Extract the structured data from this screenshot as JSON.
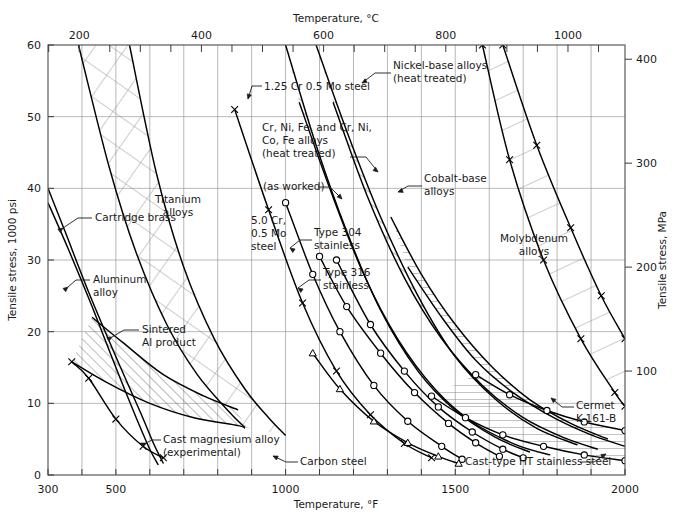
{
  "chart_data": {
    "type": "line",
    "title": "",
    "xlabel": "Temperature, °F",
    "xlabel_top": "Temperature, °C",
    "ylabel": "Tensile stress, 1000 psi",
    "ylabel_right": "Tensile stress, MPa",
    "xlim": [
      300,
      2000
    ],
    "ylim": [
      0,
      60
    ],
    "ylim_right": [
      0,
      414
    ],
    "grid": true,
    "legend_position": "in-plot annotations",
    "x_ticks_f": [
      300,
      400,
      500,
      600,
      700,
      800,
      900,
      1000,
      1100,
      1200,
      1300,
      1400,
      1500,
      1600,
      1700,
      1800,
      1900,
      2000
    ],
    "x_tick_labels_f": [
      "300",
      "",
      "500",
      "",
      "",
      "",
      "",
      "1000",
      "",
      "",
      "",
      "",
      "1500",
      "",
      "",
      "",
      "",
      "2000"
    ],
    "x_ticks_c": [
      150,
      200,
      250,
      300,
      350,
      400,
      450,
      500,
      550,
      600,
      650,
      700,
      750,
      800,
      850,
      900,
      950,
      1000,
      1050,
      1100
    ],
    "x_tick_labels_c": [
      "",
      "200",
      "",
      "",
      "",
      "400",
      "",
      "",
      "",
      "600",
      "",
      "",
      "",
      "800",
      "",
      "",
      "",
      "1000",
      "",
      ""
    ],
    "y_ticks_psi": [
      0,
      10,
      20,
      30,
      40,
      50,
      60
    ],
    "y_tick_labels_psi": [
      "0",
      "10",
      "20",
      "30",
      "40",
      "50",
      "60"
    ],
    "y_ticks_mpa": [
      100,
      200,
      300,
      400
    ],
    "y_tick_labels_mpa": [
      "100",
      "200",
      "300",
      "400"
    ],
    "series": [
      {
        "name": "Cartridge brass",
        "marker": "none",
        "points": [
          [
            300,
            40.0
          ],
          [
            350,
            34.0
          ],
          [
            420,
            25.5
          ],
          [
            500,
            16.5
          ],
          [
            570,
            9.0
          ],
          [
            610,
            4.5
          ],
          [
            640,
            1.6
          ]
        ]
      },
      {
        "name": "Aluminum alloy",
        "marker": "none",
        "points": [
          [
            300,
            38.0
          ],
          [
            360,
            31.5
          ],
          [
            430,
            23.5
          ],
          [
            500,
            15.0
          ],
          [
            560,
            8.0
          ],
          [
            600,
            3.6
          ],
          [
            625,
            1.4
          ]
        ]
      },
      {
        "name": "Cast magnesium alloy (experimental)",
        "marker": "x",
        "points": [
          [
            370,
            15.8
          ],
          [
            420,
            13.5
          ],
          [
            500,
            7.8
          ],
          [
            580,
            4.0
          ],
          [
            640,
            2.4
          ]
        ]
      },
      {
        "name": "Sintered Al product upper",
        "marker": "none",
        "points": [
          [
            430,
            22.0
          ],
          [
            520,
            18.5
          ],
          [
            640,
            14.0
          ],
          [
            760,
            11.0
          ],
          [
            860,
            9.1
          ]
        ]
      },
      {
        "name": "Sintered Al product lower",
        "marker": "none",
        "points": [
          [
            370,
            15.8
          ],
          [
            470,
            13.0
          ],
          [
            600,
            10.0
          ],
          [
            730,
            8.0
          ],
          [
            860,
            6.9
          ],
          [
            880,
            6.5
          ]
        ]
      },
      {
        "name": "Titanium alloys band upper",
        "marker": "none",
        "points": [
          [
            390,
            60.0
          ],
          [
            480,
            43.0
          ],
          [
            560,
            31.0
          ],
          [
            650,
            21.0
          ],
          [
            740,
            14.0
          ],
          [
            830,
            9.0
          ],
          [
            880,
            6.6
          ]
        ]
      },
      {
        "name": "Titanium alloys band lower",
        "marker": "none",
        "points": [
          [
            540,
            60.0
          ],
          [
            620,
            42.0
          ],
          [
            700,
            29.0
          ],
          [
            790,
            19.0
          ],
          [
            880,
            12.0
          ],
          [
            950,
            8.0
          ],
          [
            1000,
            5.5
          ]
        ]
      },
      {
        "name": "1.25 Cr 0.5 Mo steel",
        "marker": "x",
        "points": [
          [
            850,
            51.0
          ],
          [
            950,
            37.0
          ],
          [
            1050,
            24.0
          ],
          [
            1150,
            14.5
          ],
          [
            1250,
            8.4
          ],
          [
            1350,
            4.4
          ],
          [
            1430,
            2.4
          ]
        ]
      },
      {
        "name": "5.0 Cr, 0.5 Mo steel",
        "marker": "circle",
        "points": [
          [
            1000,
            38.0
          ],
          [
            1080,
            28.0
          ],
          [
            1160,
            20.0
          ],
          [
            1260,
            12.5
          ],
          [
            1360,
            7.5
          ],
          [
            1460,
            4.0
          ],
          [
            1520,
            2.2
          ]
        ]
      },
      {
        "name": "Type 304 stainless",
        "marker": "circle",
        "points": [
          [
            1100,
            30.5
          ],
          [
            1180,
            23.5
          ],
          [
            1280,
            17.0
          ],
          [
            1380,
            11.5
          ],
          [
            1480,
            7.2
          ],
          [
            1560,
            4.5
          ],
          [
            1630,
            2.6
          ]
        ]
      },
      {
        "name": "Type 316 stainless",
        "marker": "circle",
        "points": [
          [
            1150,
            30.0
          ],
          [
            1250,
            21.0
          ],
          [
            1350,
            14.5
          ],
          [
            1450,
            9.5
          ],
          [
            1550,
            6.0
          ],
          [
            1640,
            3.6
          ],
          [
            1700,
            2.4
          ]
        ]
      },
      {
        "name": "Carbon steel",
        "marker": "triangle",
        "points": [
          [
            1080,
            17.0
          ],
          [
            1160,
            12.0
          ],
          [
            1260,
            7.5
          ],
          [
            1360,
            4.5
          ],
          [
            1450,
            2.6
          ],
          [
            1510,
            1.6
          ]
        ]
      },
      {
        "name": "Cr, Ni, Fe, and Cr, Ni, Co, Fe alloys (heat treated) upper",
        "marker": "none",
        "points": [
          [
            1000,
            60.0
          ],
          [
            1090,
            46.0
          ],
          [
            1180,
            34.0
          ],
          [
            1280,
            23.0
          ],
          [
            1390,
            14.5
          ],
          [
            1500,
            9.0
          ],
          [
            1620,
            5.2
          ],
          [
            1720,
            3.2
          ]
        ]
      },
      {
        "name": "Cr, Ni, Fe, and Cr, Ni, Co, Fe alloys (as worked) lower",
        "marker": "none",
        "points": [
          [
            1040,
            52.0
          ],
          [
            1130,
            40.0
          ],
          [
            1230,
            28.0
          ],
          [
            1330,
            19.0
          ],
          [
            1440,
            12.0
          ],
          [
            1550,
            7.4
          ],
          [
            1680,
            4.2
          ],
          [
            1780,
            2.8
          ]
        ]
      },
      {
        "name": "Nickel-base alloys (heat treated) upper",
        "marker": "none",
        "points": [
          [
            1090,
            60.0
          ],
          [
            1180,
            48.0
          ],
          [
            1280,
            36.0
          ],
          [
            1390,
            25.0
          ],
          [
            1500,
            16.5
          ],
          [
            1620,
            10.5
          ],
          [
            1740,
            6.5
          ],
          [
            1860,
            4.2
          ]
        ]
      },
      {
        "name": "Nickel-base alloys (heat treated) lower",
        "marker": "none",
        "points": [
          [
            1140,
            52.0
          ],
          [
            1240,
            39.0
          ],
          [
            1350,
            27.5
          ],
          [
            1460,
            19.0
          ],
          [
            1580,
            12.5
          ],
          [
            1700,
            8.0
          ],
          [
            1820,
            5.2
          ],
          [
            1920,
            3.6
          ]
        ]
      },
      {
        "name": "Cobalt-base alloys upper",
        "marker": "none",
        "points": [
          [
            1310,
            36.0
          ],
          [
            1400,
            28.0
          ],
          [
            1500,
            21.0
          ],
          [
            1610,
            15.0
          ],
          [
            1720,
            10.5
          ],
          [
            1840,
            7.2
          ],
          [
            1950,
            5.0
          ]
        ]
      },
      {
        "name": "Cobalt-base alloys lower",
        "marker": "none",
        "points": [
          [
            1360,
            29.0
          ],
          [
            1460,
            22.0
          ],
          [
            1560,
            16.0
          ],
          [
            1670,
            11.5
          ],
          [
            1790,
            8.0
          ],
          [
            1900,
            5.6
          ],
          [
            2000,
            4.0
          ]
        ]
      },
      {
        "name": "Molybdenum alloys upper",
        "marker": "x",
        "points": [
          [
            1640,
            60.0
          ],
          [
            1740,
            46.0
          ],
          [
            1840,
            34.5
          ],
          [
            1930,
            25.0
          ],
          [
            2000,
            19.0
          ]
        ]
      },
      {
        "name": "Molybdenum alloys lower",
        "marker": "x",
        "points": [
          [
            1580,
            60.0
          ],
          [
            1660,
            44.0
          ],
          [
            1760,
            30.0
          ],
          [
            1870,
            19.0
          ],
          [
            1970,
            11.5
          ],
          [
            2000,
            9.6
          ]
        ]
      },
      {
        "name": "Cermet K-161-B",
        "marker": "circle",
        "points": [
          [
            1560,
            14.0
          ],
          [
            1660,
            11.2
          ],
          [
            1770,
            9.0
          ],
          [
            1880,
            7.4
          ],
          [
            2000,
            6.2
          ]
        ]
      },
      {
        "name": "Cast-type HT stainless steel",
        "marker": "circle",
        "points": [
          [
            1430,
            11.0
          ],
          [
            1530,
            8.0
          ],
          [
            1640,
            5.6
          ],
          [
            1760,
            4.0
          ],
          [
            1880,
            2.8
          ],
          [
            2000,
            2.0
          ]
        ]
      }
    ],
    "annotations": [
      {
        "text": "Cartridge brass",
        "x": 95,
        "y": 221,
        "anchor": "start",
        "leader": true
      },
      {
        "text": "Aluminum\nalloy",
        "x": 93,
        "y": 283,
        "anchor": "start",
        "leader": true
      },
      {
        "text": "Sintered\nAl product",
        "x": 142,
        "y": 333,
        "anchor": "start",
        "leader": true
      },
      {
        "text": "Cast magnesium alloy\n(experimental)",
        "x": 163,
        "y": 443,
        "anchor": "start",
        "leader": true
      },
      {
        "text": "Titanium\nalloys",
        "x": 178,
        "y": 203,
        "anchor": "middle",
        "leader": false
      },
      {
        "text": "1.25 Cr 0.5 Mo steel",
        "x": 264,
        "y": 90,
        "anchor": "start",
        "leader": true
      },
      {
        "text": "Cr, Ni, Fe, and Cr, Ni,\nCo, Fe alloys\n(heat treated)",
        "x": 262,
        "y": 131,
        "anchor": "start",
        "leader": true
      },
      {
        "text": "(as worked)",
        "x": 263,
        "y": 190,
        "anchor": "start",
        "leader": true
      },
      {
        "text": "5.0 Cr,\n0.5 Mo\nsteel",
        "x": 251,
        "y": 224,
        "anchor": "start",
        "leader": false
      },
      {
        "text": "Type 304\nstainless",
        "x": 314,
        "y": 236,
        "anchor": "start",
        "leader": true
      },
      {
        "text": "Type 316\nstainless",
        "x": 323,
        "y": 276,
        "anchor": "start",
        "leader": true
      },
      {
        "text": "Nickel-base alloys\n(heat treated)",
        "x": 393,
        "y": 69,
        "anchor": "start",
        "leader": true
      },
      {
        "text": "Cobalt-base\nalloys",
        "x": 424,
        "y": 182,
        "anchor": "start",
        "leader": true
      },
      {
        "text": "Molybdenum\nalloys",
        "x": 534,
        "y": 242,
        "anchor": "middle",
        "leader": false
      },
      {
        "text": "Cermet\nK-161-B",
        "x": 576,
        "y": 409,
        "anchor": "start",
        "leader": true
      },
      {
        "text": "Carbon steel",
        "x": 300,
        "y": 465,
        "anchor": "start",
        "leader": true
      },
      {
        "text": "Cast-type HT stainless steel",
        "x": 465,
        "y": 465,
        "anchor": "start",
        "leader": true
      }
    ],
    "regions": [
      {
        "name": "Titanium alloys",
        "hatch": "cross"
      },
      {
        "name": "Nickel-base alloys",
        "hatch": "diagonal"
      },
      {
        "name": "Cobalt-base alloys",
        "hatch": "horizontal"
      },
      {
        "name": "Molybdenum alloys",
        "hatch": "diagonal-wide"
      },
      {
        "name": "Sintered Al product",
        "hatch": "diagonal"
      }
    ],
    "colors": {
      "curve": "#000000",
      "grid": "#8a8a8a",
      "axis": "#4a4a4a",
      "hatch": "#8a8a8a",
      "text": "#1a1a1a",
      "background": "#ffffff"
    }
  },
  "axes": {
    "top_title": "Temperature, °C",
    "bottom_title": "Temperature, °F",
    "left_title": "Tensile stress, 1000 psi",
    "right_title": "Tensile stress, MPa"
  }
}
